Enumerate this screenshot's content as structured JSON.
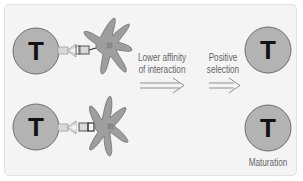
{
  "diagram": {
    "colors": {
      "background": "#f4f4f4",
      "cell_fill": "#b3b3b3",
      "cell_stroke": "#6e6e6e",
      "dendritic_fill": "#9e9e9e",
      "receptor_fill": "#d9d9d9",
      "text": "#666666",
      "letter": "#111111"
    },
    "cells": {
      "t_cell_top_left": {
        "letter": "T"
      },
      "t_cell_bottom_left": {
        "letter": "T"
      },
      "t_cell_top_right": {
        "letter": "T"
      },
      "t_cell_bottom_right": {
        "letter": "T"
      }
    },
    "labels": {
      "lower_affinity_line1": "Lower affinity",
      "lower_affinity_line2": "of interaction",
      "positive_selection_line1": "Positive",
      "positive_selection_line2": "selection",
      "maturation": "Maturation"
    }
  }
}
